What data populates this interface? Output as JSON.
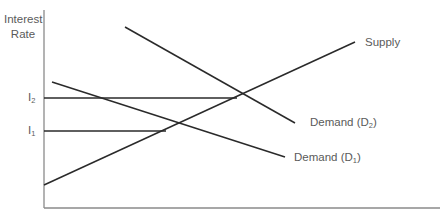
{
  "diagram": {
    "type": "supply-demand",
    "y_axis_label": [
      "Interest",
      "Rate"
    ],
    "x_axis_label": "",
    "levels": [
      {
        "id": "I2",
        "label": "I",
        "subscript": "2"
      },
      {
        "id": "I1",
        "label": "I",
        "subscript": "1"
      }
    ],
    "curves": [
      {
        "id": "supply",
        "label": "Supply",
        "subscript": ""
      },
      {
        "id": "demand-d2",
        "label": "Demand (D",
        "subscript": "2",
        "suffix": ")"
      },
      {
        "id": "demand-d1",
        "label": "Demand (D",
        "subscript": "1",
        "suffix": ")"
      }
    ],
    "colors": {
      "line": "#2a2a2a",
      "axis": "#777777",
      "text": "#5a5a5a"
    }
  }
}
